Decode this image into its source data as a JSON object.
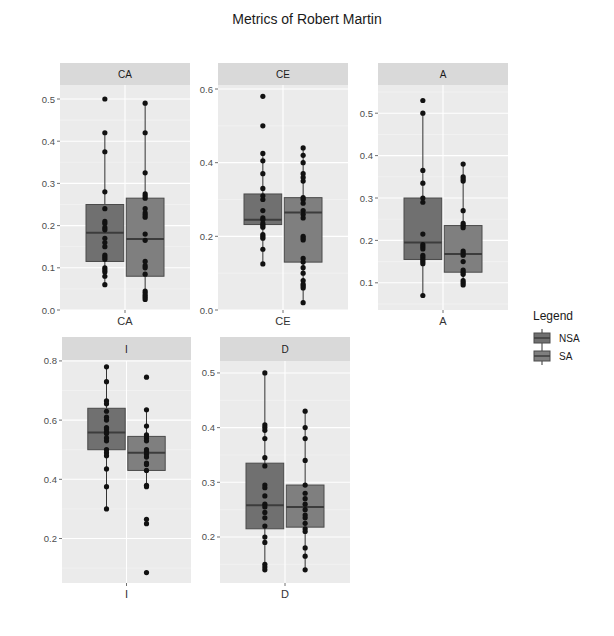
{
  "chart_data": {
    "type": "box",
    "title": "Metrics of Robert Martin",
    "legend": {
      "title": "Legend",
      "position": "right",
      "entries": [
        {
          "label": "NSA",
          "fill": "#707070"
        },
        {
          "label": "SA",
          "fill": "#7f7f7f"
        }
      ]
    },
    "grid": true,
    "panels": [
      {
        "name": "CA",
        "xlabel": "CA",
        "ylim": [
          0.0,
          0.5
        ],
        "ticks": [
          0.0,
          0.1,
          0.2,
          0.3,
          0.4,
          0.5
        ],
        "series": [
          {
            "name": "NSA",
            "box": {
              "min": 0.06,
              "q1": 0.115,
              "median": 0.183,
              "q3": 0.25,
              "max": 0.42
            },
            "points": [
              0.5,
              0.42,
              0.375,
              0.28,
              0.24,
              0.21,
              0.205,
              0.195,
              0.19,
              0.17,
              0.16,
              0.15,
              0.13,
              0.125,
              0.12,
              0.1,
              0.095,
              0.09,
              0.08,
              0.06
            ]
          },
          {
            "name": "SA",
            "box": {
              "min": 0.025,
              "q1": 0.08,
              "median": 0.168,
              "q3": 0.265,
              "max": 0.49
            },
            "points": [
              0.49,
              0.42,
              0.325,
              0.275,
              0.27,
              0.265,
              0.24,
              0.23,
              0.225,
              0.22,
              0.18,
              0.165,
              0.115,
              0.105,
              0.1,
              0.085,
              0.045,
              0.04,
              0.035,
              0.03,
              0.025
            ]
          }
        ]
      },
      {
        "name": "CE",
        "xlabel": "CE",
        "ylim": [
          0.0,
          0.6
        ],
        "ticks": [
          0.0,
          0.2,
          0.4,
          0.6
        ],
        "series": [
          {
            "name": "NSA",
            "box": {
              "min": 0.125,
              "q1": 0.232,
              "median": 0.245,
              "q3": 0.315,
              "max": 0.425
            },
            "points": [
              0.58,
              0.5,
              0.425,
              0.405,
              0.37,
              0.33,
              0.31,
              0.3,
              0.27,
              0.25,
              0.245,
              0.235,
              0.23,
              0.225,
              0.205,
              0.2,
              0.195,
              0.165,
              0.125
            ]
          },
          {
            "name": "SA",
            "box": {
              "min": 0.02,
              "q1": 0.13,
              "median": 0.265,
              "q3": 0.305,
              "max": 0.44
            },
            "points": [
              0.44,
              0.42,
              0.4,
              0.37,
              0.36,
              0.35,
              0.305,
              0.3,
              0.29,
              0.27,
              0.26,
              0.25,
              0.2,
              0.195,
              0.19,
              0.14,
              0.13,
              0.115,
              0.1,
              0.08,
              0.07,
              0.065,
              0.06,
              0.02
            ]
          }
        ]
      },
      {
        "name": "A",
        "xlabel": "A",
        "ylim": [
          0.05,
          0.55
        ],
        "ticks": [
          0.1,
          0.2,
          0.3,
          0.4,
          0.5
        ],
        "series": [
          {
            "name": "NSA",
            "box": {
              "min": 0.07,
              "q1": 0.155,
              "median": 0.195,
              "q3": 0.3,
              "max": 0.5
            },
            "points": [
              0.53,
              0.5,
              0.365,
              0.335,
              0.3,
              0.29,
              0.215,
              0.19,
              0.185,
              0.18,
              0.165,
              0.16,
              0.155,
              0.15,
              0.145,
              0.07
            ]
          },
          {
            "name": "SA",
            "box": {
              "min": 0.095,
              "q1": 0.125,
              "median": 0.168,
              "q3": 0.235,
              "max": 0.38
            },
            "points": [
              0.38,
              0.35,
              0.345,
              0.34,
              0.27,
              0.24,
              0.235,
              0.23,
              0.175,
              0.17,
              0.165,
              0.15,
              0.13,
              0.125,
              0.12,
              0.105,
              0.1,
              0.095
            ]
          }
        ]
      },
      {
        "name": "I",
        "xlabel": "I",
        "ylim": [
          0.07,
          0.82
        ],
        "ticks": [
          0.2,
          0.4,
          0.6,
          0.8
        ],
        "series": [
          {
            "name": "NSA",
            "box": {
              "min": 0.3,
              "q1": 0.5,
              "median": 0.558,
              "q3": 0.64,
              "max": 0.78
            },
            "points": [
              0.78,
              0.73,
              0.665,
              0.655,
              0.63,
              0.61,
              0.6,
              0.575,
              0.57,
              0.56,
              0.555,
              0.54,
              0.53,
              0.5,
              0.49,
              0.48,
              0.435,
              0.375,
              0.3
            ]
          },
          {
            "name": "SA",
            "box": {
              "min": 0.38,
              "q1": 0.43,
              "median": 0.49,
              "q3": 0.545,
              "max": 0.635
            },
            "points": [
              0.745,
              0.635,
              0.58,
              0.55,
              0.54,
              0.53,
              0.5,
              0.495,
              0.485,
              0.475,
              0.455,
              0.45,
              0.43,
              0.38,
              0.375,
              0.265,
              0.25,
              0.085
            ]
          }
        ]
      },
      {
        "name": "D",
        "xlabel": "D",
        "ylim": [
          0.125,
          0.52
        ],
        "ticks": [
          0.2,
          0.3,
          0.4,
          0.5
        ],
        "series": [
          {
            "name": "NSA",
            "box": {
              "min": 0.14,
              "q1": 0.215,
              "median": 0.258,
              "q3": 0.335,
              "max": 0.5
            },
            "points": [
              0.5,
              0.405,
              0.4,
              0.395,
              0.38,
              0.345,
              0.33,
              0.295,
              0.29,
              0.275,
              0.26,
              0.255,
              0.245,
              0.235,
              0.22,
              0.2,
              0.19,
              0.15,
              0.145,
              0.14
            ]
          },
          {
            "name": "SA",
            "box": {
              "min": 0.14,
              "q1": 0.218,
              "median": 0.255,
              "q3": 0.295,
              "max": 0.43
            },
            "points": [
              0.43,
              0.4,
              0.38,
              0.34,
              0.295,
              0.28,
              0.27,
              0.26,
              0.25,
              0.24,
              0.235,
              0.225,
              0.215,
              0.21,
              0.18,
              0.165,
              0.14
            ]
          }
        ]
      }
    ]
  },
  "layout": {
    "title_x": 307,
    "title_y": 24,
    "panels": [
      {
        "x": 60,
        "y": 63,
        "w": 130,
        "strip_h": 22,
        "top": 85,
        "bottom": 310,
        "ymin_px": 310,
        "ymax_px": 99
      },
      {
        "x": 218,
        "y": 63,
        "w": 130,
        "strip_h": 22,
        "top": 85,
        "bottom": 310,
        "ymin_px": 310,
        "ymax_px": 89
      },
      {
        "x": 378,
        "y": 63,
        "w": 130,
        "strip_h": 22,
        "top": 85,
        "bottom": 310,
        "ymin_px": 304,
        "ymax_px": 92
      },
      {
        "x": 62,
        "y": 337,
        "w": 129,
        "strip_h": 24,
        "top": 361,
        "bottom": 583,
        "ymin_px": 577,
        "ymax_px": 355
      },
      {
        "x": 220,
        "y": 337,
        "w": 130,
        "strip_h": 24,
        "top": 361,
        "bottom": 583,
        "ymin_px": 578,
        "ymax_px": 362
      }
    ],
    "legend": {
      "x": 533,
      "y": 308
    }
  }
}
